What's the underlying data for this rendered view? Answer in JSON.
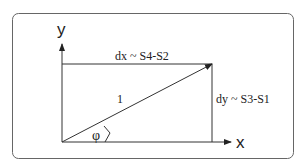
{
  "diagram": {
    "axes": {
      "y_label": "y",
      "x_label": "x"
    },
    "labels": {
      "dx": "dx ~ S4-S2",
      "dy": "dy ~ S3-S1",
      "hypotenuse": "1",
      "angle": "φ"
    },
    "colors": {
      "stroke": "#333333",
      "frame": "#666666",
      "background": "#ffffff"
    }
  }
}
